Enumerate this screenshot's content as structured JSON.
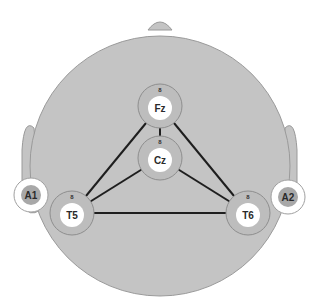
{
  "diagram": {
    "electrodes": [
      {
        "id": "Fz",
        "label": "Fz",
        "marker": "8"
      },
      {
        "id": "Cz",
        "label": "Cz",
        "marker": "8"
      },
      {
        "id": "T5",
        "label": "T5",
        "marker": "8"
      },
      {
        "id": "T6",
        "label": "T6",
        "marker": "8"
      }
    ],
    "references": [
      {
        "id": "A1",
        "label": "A1"
      },
      {
        "id": "A2",
        "label": "A2"
      }
    ],
    "connections": [
      [
        "Fz",
        "Cz"
      ],
      [
        "Fz",
        "T5"
      ],
      [
        "Fz",
        "T6"
      ],
      [
        "Cz",
        "T5"
      ],
      [
        "Cz",
        "T6"
      ],
      [
        "T5",
        "T6"
      ]
    ],
    "colors": {
      "head": "#c4c4c4",
      "head_outline": "#9a9a9a",
      "electrode_ring": "#bdbdbd",
      "electrode_center": "#ffffff",
      "reference_inner": "#a8a8a8",
      "line": "#1e1e1e"
    }
  }
}
